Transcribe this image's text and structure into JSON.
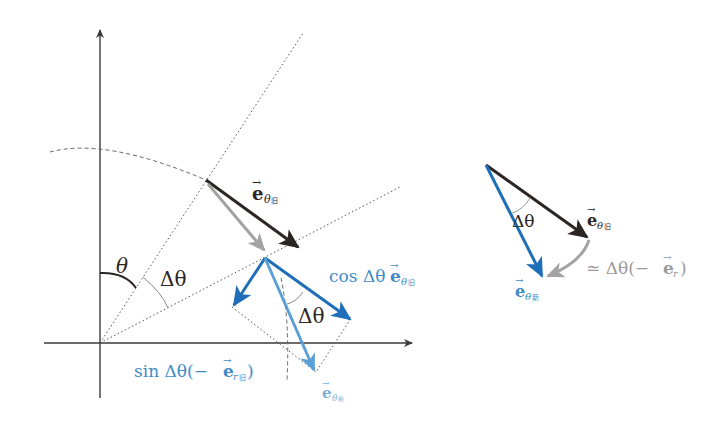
{
  "colors": {
    "axis": "#3a3a3a",
    "black_vector": "#2b2523",
    "gray_vector": "#a3a3a3",
    "blue_dark": "#1f6fb8",
    "blue_light": "#5a9fd6",
    "label_blue": "#3f8bc9",
    "label_gray": "#9a9a9a",
    "dotted": "#555555"
  },
  "left_diagram": {
    "angle_theta": "θ",
    "angle_delta_theta_origin": "Δθ",
    "angle_delta_theta_vectors": "Δθ",
    "e_theta_old": {
      "base": "e",
      "sub": "θ",
      "sub_mark": "旧"
    },
    "cos_term": {
      "prefix": "cos Δθ",
      "base": "e",
      "sub": "θ",
      "sub_mark": "旧"
    },
    "sin_term": {
      "prefix": "sin Δθ(−",
      "base": "e",
      "sub": "r",
      "sub_mark": "旧",
      "suffix": ")"
    },
    "e_theta_new": {
      "base": "e",
      "sub": "θ",
      "sub_mark": "新"
    }
  },
  "right_diagram": {
    "angle_delta_theta": "Δθ",
    "e_theta_old": {
      "base": "e",
      "sub": "θ",
      "sub_mark": "旧"
    },
    "e_theta_new": {
      "base": "e",
      "sub": "θ",
      "sub_mark": "新"
    },
    "approx_term": {
      "prefix": "≃ Δθ(−",
      "base": "e",
      "sub": "r",
      "suffix": ")"
    }
  }
}
